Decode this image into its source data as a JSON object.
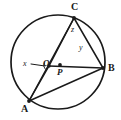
{
  "figure": {
    "type": "euclidean-geometry-diagram",
    "stroke_color": "#1a1a1a",
    "background_color": "#ffffff"
  },
  "circle": {
    "name": "circle-outline",
    "center_x": 58,
    "center_y": 62,
    "radius": 47
  },
  "points": [
    {
      "id": "C",
      "label": "C",
      "x": 74,
      "y": 18,
      "label_x": 71,
      "label_y": 3,
      "on_circle": true
    },
    {
      "id": "B",
      "label": "B",
      "x": 103,
      "y": 68,
      "label_x": 107,
      "label_y": 65,
      "on_circle": true
    },
    {
      "id": "A",
      "label": "A",
      "x": 29,
      "y": 101,
      "label_x": 22,
      "label_y": 105,
      "on_circle": true
    },
    {
      "id": "O",
      "label": "O",
      "x": 49,
      "y": 66,
      "label_x": 44,
      "label_y": 62,
      "on_circle": false
    },
    {
      "id": "P",
      "label": "P",
      "x": 60,
      "y": 65,
      "label_x": 58,
      "label_y": 69,
      "on_circle": false
    }
  ],
  "angles": [
    {
      "id": "x",
      "label": "x",
      "label_x": 24,
      "label_y": 62,
      "at_vertex": "O",
      "has_leader": true
    },
    {
      "id": "z",
      "label": "z",
      "label_x": 72,
      "label_y": 27,
      "at_vertex": "C",
      "has_leader": false
    },
    {
      "id": "y",
      "label": "y",
      "label_x": 80,
      "label_y": 45,
      "at_vertex": "inner",
      "has_leader": false
    }
  ],
  "segments": [
    {
      "name": "segment-C-to-O",
      "from": "C",
      "to": "O"
    },
    {
      "name": "segment-C-to-B",
      "from": "C",
      "to": "B"
    },
    {
      "name": "segment-C-to-A",
      "from": "C",
      "to": "A"
    },
    {
      "name": "segment-A-to-B",
      "from": "A",
      "to": "B"
    },
    {
      "name": "segment-O-to-B",
      "from": "O",
      "to": "B"
    },
    {
      "name": "segment-A-to-O",
      "from": "A",
      "to": "O"
    }
  ],
  "leader": {
    "name": "x-leader-line",
    "from_x": 31,
    "from_y": 64,
    "to_x": 45,
    "to_y": 66
  }
}
